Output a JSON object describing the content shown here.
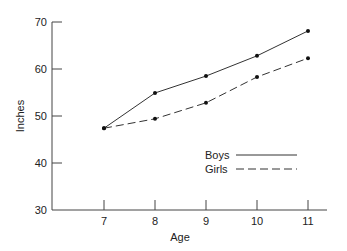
{
  "chart_data": {
    "type": "line",
    "title": "",
    "xlabel": "Age",
    "ylabel": "Inches",
    "x": [
      7,
      8,
      9,
      10,
      11
    ],
    "categories": [
      "7",
      "8",
      "9",
      "10",
      "11"
    ],
    "xlim": [
      6,
      11.5
    ],
    "ylim": [
      30,
      70
    ],
    "yticks": [
      30,
      40,
      50,
      60,
      70
    ],
    "grid": false,
    "legend_position": "lower right",
    "series": [
      {
        "name": "Boys",
        "style": "solid",
        "values": [
          47.4,
          54.9,
          58.5,
          62.8,
          68.1
        ]
      },
      {
        "name": "Girls",
        "style": "dashed",
        "values": [
          47.4,
          49.4,
          52.8,
          58.3,
          62.3
        ]
      }
    ]
  },
  "legend": {
    "items": [
      {
        "label": "Boys",
        "style": "solid"
      },
      {
        "label": "Girls",
        "style": "dashed"
      }
    ]
  },
  "colors": {
    "line": "#333333",
    "axis": "#444444",
    "text": "#222222"
  }
}
